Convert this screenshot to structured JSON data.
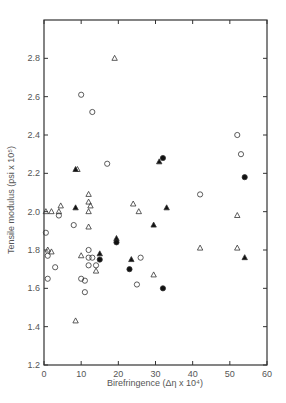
{
  "chart_data": {
    "type": "scatter",
    "title": "",
    "xlabel": "Birefringence (Δη x 10⁴)",
    "ylabel": "Tensile modulus (psi x 10⁵)",
    "xlim": [
      0,
      60
    ],
    "ylim": [
      1.2,
      3.0
    ],
    "xticks": [
      0,
      10,
      20,
      30,
      40,
      50,
      60
    ],
    "yticks": [
      1.2,
      1.4,
      1.6,
      1.8,
      2.0,
      2.2,
      2.4,
      2.6,
      2.8
    ],
    "grid": false,
    "legend": "none",
    "series": [
      {
        "name": "open-circle",
        "marker": "circle",
        "filled": false,
        "points": [
          [
            10,
            2.61
          ],
          [
            13,
            2.52
          ],
          [
            17,
            2.25
          ],
          [
            0.5,
            1.89
          ],
          [
            1,
            1.77
          ],
          [
            4,
            1.98
          ],
          [
            3,
            1.71
          ],
          [
            1,
            1.65
          ],
          [
            8,
            1.93
          ],
          [
            10,
            1.65
          ],
          [
            11,
            1.64
          ],
          [
            11,
            1.58
          ],
          [
            12,
            1.8
          ],
          [
            12,
            1.76
          ],
          [
            13,
            1.76
          ],
          [
            12,
            1.72
          ],
          [
            14,
            1.72
          ],
          [
            26,
            1.76
          ],
          [
            25,
            1.62
          ],
          [
            42,
            2.09
          ],
          [
            52,
            2.4
          ],
          [
            53,
            2.3
          ]
        ]
      },
      {
        "name": "open-triangle",
        "marker": "triangle",
        "filled": false,
        "points": [
          [
            19,
            2.8
          ],
          [
            9,
            2.22
          ],
          [
            0.5,
            2.0
          ],
          [
            2,
            2.0
          ],
          [
            4.5,
            2.03
          ],
          [
            4,
            2.0
          ],
          [
            12,
            2.09
          ],
          [
            12,
            2.05
          ],
          [
            12.5,
            2.03
          ],
          [
            12,
            2.0
          ],
          [
            12,
            1.92
          ],
          [
            1,
            1.8
          ],
          [
            2,
            1.79
          ],
          [
            10,
            1.77
          ],
          [
            14,
            1.69
          ],
          [
            8.5,
            1.43
          ],
          [
            24,
            2.04
          ],
          [
            25.5,
            2.0
          ],
          [
            29.5,
            1.67
          ],
          [
            52,
            1.98
          ],
          [
            52,
            1.81
          ],
          [
            42,
            1.81
          ]
        ]
      },
      {
        "name": "filled-triangle",
        "marker": "triangle",
        "filled": true,
        "points": [
          [
            8.5,
            2.22
          ],
          [
            8.5,
            2.02
          ],
          [
            15,
            1.78
          ],
          [
            19.5,
            1.86
          ],
          [
            23.5,
            1.75
          ],
          [
            31,
            2.26
          ],
          [
            33,
            2.02
          ],
          [
            29.5,
            1.93
          ],
          [
            54,
            1.76
          ]
        ]
      },
      {
        "name": "filled-circle",
        "marker": "circle",
        "filled": true,
        "points": [
          [
            15,
            1.75
          ],
          [
            19.5,
            1.84
          ],
          [
            23,
            1.7
          ],
          [
            32,
            1.6
          ],
          [
            32,
            2.28
          ],
          [
            54,
            2.18
          ]
        ]
      }
    ]
  }
}
